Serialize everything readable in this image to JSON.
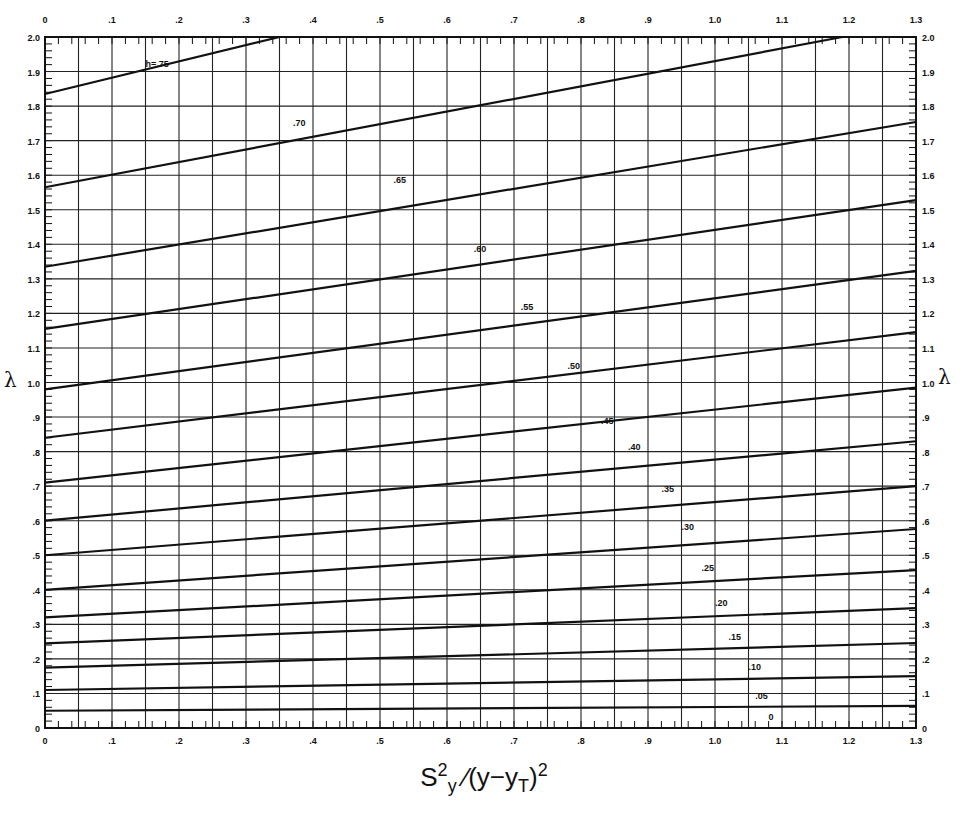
{
  "chart_data": {
    "type": "line",
    "title": "",
    "xlabel": "S²_y / (y − y_T)²",
    "xlabel_parts": {
      "s": "S",
      "sup1": "2",
      "sub1": "y",
      "slash": "⁄",
      "mid": "(y−y",
      "sub2": "T",
      "close": ")",
      "sup2": "2"
    },
    "ylabel": "λ",
    "xlim": [
      0,
      1.3
    ],
    "ylim": [
      0,
      2.0
    ],
    "grid": true,
    "legend": "none (curves labeled inline by h)",
    "x_ticks": [
      "0",
      ".1",
      ".2",
      ".3",
      ".4",
      ".5",
      ".6",
      ".7",
      ".8",
      ".9",
      "1.0",
      "1.1",
      "1.2",
      "1.3"
    ],
    "x_tick_values": [
      0,
      0.1,
      0.2,
      0.3,
      0.4,
      0.5,
      0.6,
      0.7,
      0.8,
      0.9,
      1.0,
      1.1,
      1.2,
      1.3
    ],
    "y_ticks": [
      "0",
      ".1",
      ".2",
      ".3",
      ".4",
      ".5",
      ".6",
      ".7",
      ".8",
      ".9",
      "1.0",
      "1.1",
      "1.2",
      "1.3",
      "1.4",
      "1.5",
      "1.6",
      "1.7",
      "1.8",
      "1.9",
      "2.0"
    ],
    "y_tick_values": [
      0,
      0.1,
      0.2,
      0.3,
      0.4,
      0.5,
      0.6,
      0.7,
      0.8,
      0.9,
      1.0,
      1.1,
      1.2,
      1.3,
      1.4,
      1.5,
      1.6,
      1.7,
      1.8,
      1.9,
      2.0
    ],
    "x_major_gridlines": [
      0.05,
      0.1,
      0.15,
      0.2,
      0.25,
      0.3,
      0.35,
      0.4,
      0.45,
      0.5,
      0.55,
      0.6,
      0.65,
      0.7,
      0.75,
      0.8,
      0.85,
      0.9,
      0.95,
      1.0,
      1.05,
      1.1,
      1.15,
      1.2,
      1.25
    ],
    "series": [
      {
        "name": "h=.75",
        "label": "h=.75",
        "x": [
          0,
          0.35
        ],
        "y": [
          1.835,
          2.0
        ],
        "label_at": [
          0.15,
          1.905
        ]
      },
      {
        "name": ".70",
        "label": ".70",
        "x": [
          0,
          1.19
        ],
        "y": [
          1.565,
          2.0
        ],
        "label_at": [
          0.37,
          1.735
        ]
      },
      {
        "name": ".65",
        "label": ".65",
        "x": [
          0,
          1.3
        ],
        "y": [
          1.335,
          1.754
        ],
        "label_at": [
          0.52,
          1.57
        ]
      },
      {
        "name": ".60",
        "label": ".60",
        "x": [
          0,
          1.3
        ],
        "y": [
          1.155,
          1.528
        ],
        "label_at": [
          0.64,
          1.37
        ]
      },
      {
        "name": ".55",
        "label": ".55",
        "x": [
          0,
          1.3
        ],
        "y": [
          0.98,
          1.323
        ],
        "label_at": [
          0.71,
          1.2
        ]
      },
      {
        "name": ".50",
        "label": ".50",
        "x": [
          0,
          1.3
        ],
        "y": [
          0.84,
          1.146
        ],
        "label_at": [
          0.78,
          1.03
        ]
      },
      {
        "name": ".45",
        "label": ".45",
        "x": [
          0,
          1.3
        ],
        "y": [
          0.71,
          0.985
        ],
        "label_at": [
          0.83,
          0.87
        ]
      },
      {
        "name": ".40",
        "label": ".40",
        "x": [
          0,
          1.3
        ],
        "y": [
          0.6,
          0.83
        ],
        "label_at": [
          0.87,
          0.795
        ]
      },
      {
        "name": ".35",
        "label": ".35",
        "x": [
          0,
          1.3
        ],
        "y": [
          0.5,
          0.7
        ],
        "label_at": [
          0.92,
          0.675
        ]
      },
      {
        "name": ".30",
        "label": ".30",
        "x": [
          0,
          1.3
        ],
        "y": [
          0.4,
          0.576
        ],
        "label_at": [
          0.95,
          0.565
        ]
      },
      {
        "name": ".25",
        "label": ".25",
        "x": [
          0,
          1.3
        ],
        "y": [
          0.32,
          0.457
        ],
        "label_at": [
          0.98,
          0.445
        ]
      },
      {
        "name": ".20",
        "label": ".20",
        "x": [
          0,
          1.3
        ],
        "y": [
          0.245,
          0.347
        ],
        "label_at": [
          1.0,
          0.345
        ]
      },
      {
        "name": ".15",
        "label": ".15",
        "x": [
          0,
          1.3
        ],
        "y": [
          0.175,
          0.246
        ],
        "label_at": [
          1.02,
          0.245
        ]
      },
      {
        "name": ".10",
        "label": ".10",
        "x": [
          0,
          1.3
        ],
        "y": [
          0.11,
          0.15
        ],
        "label_at": [
          1.05,
          0.16
        ]
      },
      {
        "name": ".05",
        "label": ".05",
        "x": [
          0,
          1.3
        ],
        "y": [
          0.05,
          0.064
        ],
        "label_at": [
          1.06,
          0.075
        ]
      },
      {
        "name": "0",
        "label": "0",
        "x": [
          0,
          1.3
        ],
        "y": [
          0.0,
          0.0
        ],
        "label_at": [
          1.08,
          0.015
        ]
      }
    ]
  },
  "colors": {
    "ink": "#111111",
    "grid": "#222222",
    "paper": "#ffffff"
  },
  "axis_labels": {
    "y_left": "λ",
    "y_right": "λ"
  }
}
